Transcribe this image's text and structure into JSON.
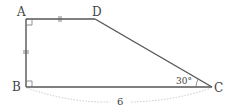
{
  "figure": {
    "type": "trapezoid",
    "vertices": {
      "A": {
        "label": "A"
      },
      "B": {
        "label": "B"
      },
      "C": {
        "label": "C"
      },
      "D": {
        "label": "D"
      }
    },
    "angle_label": "30°",
    "length_label": "6",
    "right_angles": [
      "A",
      "B"
    ],
    "equal_sides": [
      "AD",
      "AB"
    ],
    "measured_side": "BC",
    "colors": {
      "line": "#555555",
      "dashed": "#bbbbbb",
      "text": "#444444"
    }
  }
}
